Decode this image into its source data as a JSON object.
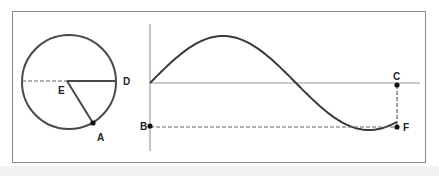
{
  "diagram": {
    "colors": {
      "stroke": "#4a4a4a",
      "frame": "#8a8a8a",
      "axis": "#999999",
      "dashed": "#666666",
      "point": "#111111",
      "background": "#ffffff",
      "strip": "#f2f2f2"
    },
    "labels": {
      "A": "A",
      "B": "B",
      "C": "C",
      "D": "D",
      "E": "E",
      "F": "F"
    },
    "circle": {
      "center": [
        69,
        82
      ],
      "radius": 47,
      "center_label": "E",
      "radius_end_point": "A",
      "horizontal_end_label": "D"
    },
    "wave": {
      "origin": [
        150,
        83
      ],
      "amplitude": 47,
      "quarter_period": 73,
      "end_x": 397,
      "end_point": "F",
      "axis_point": "C",
      "vertical_axis_point": "B"
    }
  }
}
